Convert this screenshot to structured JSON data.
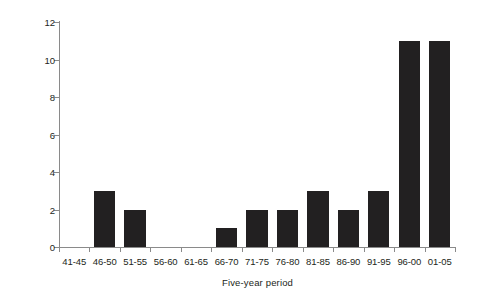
{
  "chart_data": {
    "type": "bar",
    "title": "",
    "xlabel": "Five-year period",
    "ylabel": "Number of birds",
    "categories": [
      "41-45",
      "46-50",
      "51-55",
      "56-60",
      "61-65",
      "66-70",
      "71-75",
      "76-80",
      "81-85",
      "86-90",
      "91-95",
      "96-00",
      "01-05"
    ],
    "values": [
      0,
      3,
      2,
      0,
      0,
      1,
      2,
      2,
      3,
      2,
      3,
      11,
      11
    ],
    "ylim": [
      0,
      12
    ],
    "yticks": [
      0,
      2,
      4,
      6,
      8,
      10,
      12
    ],
    "ytick_labels": [
      "0",
      "2",
      "4",
      "6",
      "8",
      "10",
      "12"
    ],
    "grid": false,
    "legend": false,
    "bar_color": "#222021",
    "axis_color": "#8a8a8a",
    "text_color": "#231f20"
  }
}
